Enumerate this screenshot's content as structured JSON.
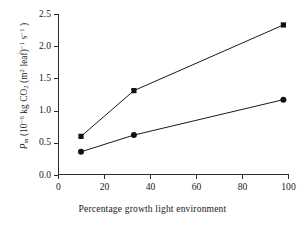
{
  "chart_data": {
    "type": "line",
    "title": "",
    "xlabel": "Percentage growth light environment",
    "ylabel": "Pm (10-6 kg CO2 (m2 leaf)-1 s-1)",
    "ylabel_parts": {
      "symbol": "P",
      "symbol_sub": "m",
      "open": " (10",
      "exp1": "−6",
      "unit1": " kg CO",
      "unit1_sub": "2",
      "unit2": " (m",
      "unit2_sup": "2",
      "unit3": " leaf)",
      "exp2": "−1",
      "unit4": " s",
      "exp3": "−1",
      "close": " )"
    },
    "xlim": [
      0,
      100
    ],
    "ylim": [
      0.0,
      2.5
    ],
    "xticks": [
      0,
      20,
      40,
      60,
      80,
      100
    ],
    "xticklabels": [
      "0",
      "20",
      "40",
      "60",
      "80",
      "100"
    ],
    "yticks": [
      0.0,
      0.5,
      1.0,
      1.5,
      2.0,
      2.5
    ],
    "yticklabels": [
      "0.0",
      "0.5",
      "1.0",
      "1.5",
      "2.0",
      "2.5"
    ],
    "grid": false,
    "legend": "none",
    "series": [
      {
        "name": "upper-series",
        "marker": "square",
        "color": "#111111",
        "x": [
          10,
          33,
          98
        ],
        "y": [
          0.6,
          1.31,
          2.33
        ]
      },
      {
        "name": "lower-series",
        "marker": "circle",
        "color": "#111111",
        "x": [
          10,
          33,
          98
        ],
        "y": [
          0.36,
          0.62,
          1.17
        ]
      }
    ]
  }
}
